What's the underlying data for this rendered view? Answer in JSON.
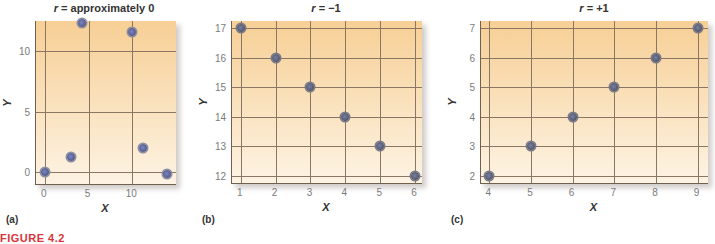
{
  "figure_caption": "FIGURE 4.2",
  "chart_data": [
    {
      "type": "scatter",
      "panel_label": "(a)",
      "title_var": "r",
      "title_rest": " = approximately 0",
      "title": "r = approximately 0",
      "xlabel": "X",
      "ylabel": "Y",
      "xlim": [
        -1,
        15
      ],
      "ylim": [
        -1,
        12.5
      ],
      "x_ticks": [
        0,
        5,
        10
      ],
      "y_ticks": [
        0,
        5,
        10
      ],
      "grid": true,
      "points": [
        {
          "x": 0,
          "y": 0
        },
        {
          "x": 3,
          "y": 1.2
        },
        {
          "x": 4.3,
          "y": 12.3
        },
        {
          "x": 10,
          "y": 11.6
        },
        {
          "x": 11.2,
          "y": 2.0
        },
        {
          "x": 14,
          "y": -0.2
        }
      ]
    },
    {
      "type": "scatter",
      "panel_label": "(b)",
      "title_var": "r",
      "title_rest": " = −1",
      "title": "r = −1",
      "xlabel": "X",
      "ylabel": "Y",
      "xlim": [
        0.75,
        6.2
      ],
      "ylim": [
        11.75,
        17.25
      ],
      "x_ticks": [
        1,
        2,
        3,
        4,
        5,
        6
      ],
      "y_ticks": [
        12,
        13,
        14,
        15,
        16,
        17
      ],
      "grid": true,
      "points": [
        {
          "x": 1,
          "y": 17
        },
        {
          "x": 2,
          "y": 16
        },
        {
          "x": 3,
          "y": 15
        },
        {
          "x": 4,
          "y": 14
        },
        {
          "x": 5,
          "y": 13
        },
        {
          "x": 6,
          "y": 12
        }
      ]
    },
    {
      "type": "scatter",
      "panel_label": "(c)",
      "title_var": "r",
      "title_rest": " = +1",
      "title": "r = +1",
      "xlabel": "X",
      "ylabel": "Y",
      "xlim": [
        3.8,
        9.25
      ],
      "ylim": [
        1.75,
        7.25
      ],
      "x_ticks": [
        4,
        5,
        6,
        7,
        8,
        9
      ],
      "y_ticks": [
        2,
        3,
        4,
        5,
        6,
        7
      ],
      "grid": true,
      "points": [
        {
          "x": 4,
          "y": 2
        },
        {
          "x": 5,
          "y": 3
        },
        {
          "x": 6,
          "y": 4
        },
        {
          "x": 7,
          "y": 5
        },
        {
          "x": 8,
          "y": 6
        },
        {
          "x": 9,
          "y": 7
        }
      ]
    }
  ],
  "colors": {
    "plot_top": "#f7cf95",
    "plot_bottom": "#fdf3e4",
    "grid": "#8a7763",
    "point_a": "#6a70b0",
    "point_bc": "#5a5e7a",
    "caption": "#d8343a"
  }
}
